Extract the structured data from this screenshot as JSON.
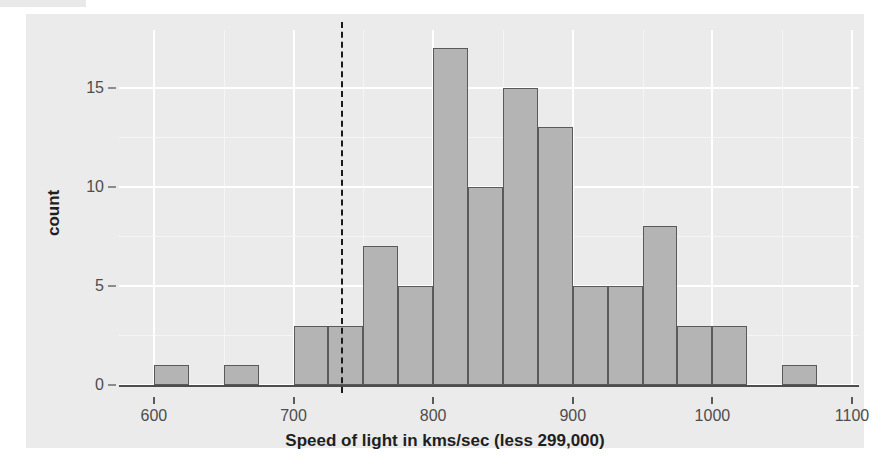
{
  "chart_data": {
    "type": "bar",
    "title": "",
    "subtitle": "",
    "xlabel": "Speed of light in kms/sec (less 299,000)",
    "ylabel": "count",
    "xlim": [
      575,
      1105
    ],
    "ylim": [
      0,
      17.9
    ],
    "x_ticks": [
      600,
      700,
      800,
      900,
      1000,
      1100
    ],
    "x_tick_labels": [
      "600",
      "700",
      "800",
      "900",
      "1000",
      "1100"
    ],
    "y_ticks": [
      0,
      5,
      10,
      15
    ],
    "y_tick_labels": [
      "0",
      "5",
      "10",
      "15"
    ],
    "x_minor_ticks": [
      650,
      750,
      850,
      950,
      1050
    ],
    "y_minor_ticks": [
      2.5,
      7.5,
      12.5
    ],
    "grid": true,
    "legend": "none",
    "bin_width": 25,
    "bins": [
      {
        "x_left": 600,
        "x_right": 625,
        "value": 1
      },
      {
        "x_left": 650,
        "x_right": 675,
        "value": 1
      },
      {
        "x_left": 700,
        "x_right": 725,
        "value": 3
      },
      {
        "x_left": 725,
        "x_right": 750,
        "value": 3
      },
      {
        "x_left": 750,
        "x_right": 775,
        "value": 7
      },
      {
        "x_left": 775,
        "x_right": 800,
        "value": 5
      },
      {
        "x_left": 800,
        "x_right": 825,
        "value": 17
      },
      {
        "x_left": 825,
        "x_right": 850,
        "value": 10
      },
      {
        "x_left": 850,
        "x_right": 875,
        "value": 15
      },
      {
        "x_left": 875,
        "x_right": 900,
        "value": 13
      },
      {
        "x_left": 900,
        "x_right": 925,
        "value": 5
      },
      {
        "x_left": 925,
        "x_right": 950,
        "value": 5
      },
      {
        "x_left": 950,
        "x_right": 975,
        "value": 8
      },
      {
        "x_left": 975,
        "x_right": 1000,
        "value": 3
      },
      {
        "x_left": 1000,
        "x_right": 1025,
        "value": 3
      },
      {
        "x_left": 1050,
        "x_right": 1075,
        "value": 1
      }
    ],
    "categories": [
      610,
      660,
      710,
      735,
      760,
      785,
      810,
      835,
      860,
      885,
      910,
      935,
      960,
      985,
      1010,
      1060
    ],
    "values": [
      1,
      1,
      3,
      3,
      7,
      5,
      17,
      10,
      15,
      13,
      5,
      5,
      8,
      3,
      3,
      1
    ],
    "annotations": [
      {
        "type": "vline",
        "x": 734,
        "linetype": "dashed",
        "color": "#1a1a1a"
      }
    ],
    "colors": {
      "bar_fill": "#b4b4b4",
      "bar_border": "#5a5a5a",
      "panel_background": "#ebebeb",
      "grid_major": "#ffffff",
      "grid_minor": "#f5f5f5",
      "axis_line": "#4d4d4d",
      "text": "#4d4d4d",
      "title_text": "#1f1f1f"
    }
  }
}
